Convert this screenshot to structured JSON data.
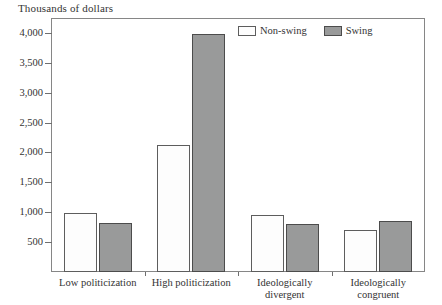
{
  "chart_data": {
    "type": "bar",
    "title": "",
    "ylabel": "Thousands of dollars",
    "xlabel": "",
    "categories": [
      "Low politicization",
      "High politicization",
      "Ideologically\ndivergent",
      "Ideologically\ncongruent"
    ],
    "series": [
      {
        "name": "Non-swing",
        "values": [
          980,
          2120,
          960,
          700
        ],
        "color": "#fdfdfd"
      },
      {
        "name": "Swing",
        "values": [
          820,
          3980,
          810,
          860
        ],
        "color": "#999a9a"
      }
    ],
    "ylim": [
      0,
      4250
    ],
    "yticks": [
      500,
      1000,
      1500,
      2000,
      2500,
      3000,
      3500,
      4000
    ],
    "ytick_labels": [
      "500",
      "1,000",
      "1,500",
      "2,000",
      "2,500",
      "3,000",
      "3,500",
      "4,000"
    ],
    "grid": false,
    "legend_position": "top-right"
  }
}
